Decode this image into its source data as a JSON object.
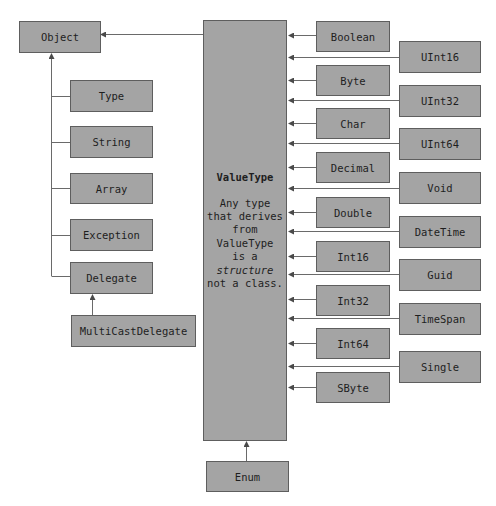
{
  "diagram": {
    "type": ".NET type hierarchy",
    "root": {
      "label": "Object"
    },
    "value_type": {
      "title": "ValueType",
      "description_lines": [
        "Any type",
        "that derives",
        "from",
        "ValueType",
        "is a",
        "structure",
        "not a class."
      ],
      "italic_word": "structure"
    },
    "object_children": [
      {
        "label": "Type"
      },
      {
        "label": "String"
      },
      {
        "label": "Array"
      },
      {
        "label": "Exception"
      },
      {
        "label": "Delegate"
      }
    ],
    "delegate_child": {
      "label": "MultiCastDelegate"
    },
    "enum": {
      "label": "Enum"
    },
    "value_types_inner": [
      {
        "label": "Boolean"
      },
      {
        "label": "Byte"
      },
      {
        "label": "Char"
      },
      {
        "label": "Decimal"
      },
      {
        "label": "Double"
      },
      {
        "label": "Int16"
      },
      {
        "label": "Int32"
      },
      {
        "label": "Int64"
      },
      {
        "label": "SByte"
      }
    ],
    "value_types_outer": [
      {
        "label": "UInt16"
      },
      {
        "label": "UInt32"
      },
      {
        "label": "UInt64"
      },
      {
        "label": "Void"
      },
      {
        "label": "DateTime"
      },
      {
        "label": "Guid"
      },
      {
        "label": "TimeSpan"
      },
      {
        "label": "Single"
      }
    ],
    "colors": {
      "box_fill": "#a4a4a4",
      "box_border": "#5e5e5e",
      "line": "#6a6a6a",
      "text": "#1e1e1e"
    }
  }
}
